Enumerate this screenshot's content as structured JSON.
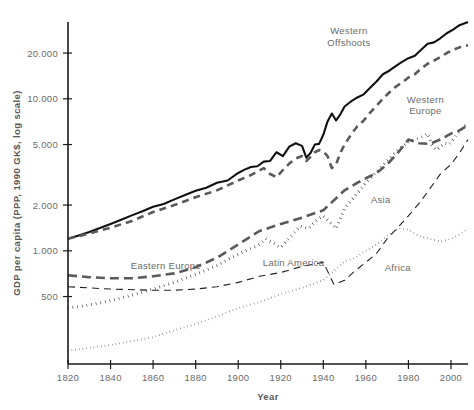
{
  "chart_data": {
    "type": "line",
    "title": "",
    "xlabel": "Year",
    "ylabel": "GDP per capita (PPP, 1990 GK$, log scale)",
    "yscale": "log",
    "xlim": [
      1820,
      2008
    ],
    "ylim": [
      180,
      32000
    ],
    "grid": false,
    "legend_position": "inline-annotations",
    "xticks": [
      1820,
      1840,
      1860,
      1880,
      1900,
      1920,
      1940,
      1960,
      1980,
      2000
    ],
    "xtick_labels": [
      "1820",
      "1840",
      "1860",
      "1880",
      "1900",
      "1920",
      "1940",
      "1960",
      "1980",
      "2000"
    ],
    "yticks": [
      500,
      1000,
      2000,
      5000,
      10000,
      20000
    ],
    "ytick_labels": [
      "500",
      "1.000",
      "2.000",
      "5.000",
      "10.000",
      "20.000"
    ],
    "series": [
      {
        "name": "Western Offshoots",
        "label": "Western Offshoots",
        "style": "solid",
        "color": "#111111",
        "width": 2.1,
        "label_x": 1952,
        "label_y": 26500,
        "x": [
          1820,
          1825,
          1830,
          1835,
          1840,
          1845,
          1850,
          1855,
          1860,
          1865,
          1870,
          1875,
          1880,
          1885,
          1890,
          1895,
          1900,
          1903,
          1906,
          1909,
          1912,
          1915,
          1918,
          1921,
          1924,
          1927,
          1930,
          1932,
          1934,
          1936,
          1938,
          1940,
          1942,
          1944,
          1946,
          1948,
          1950,
          1953,
          1956,
          1959,
          1962,
          1965,
          1968,
          1971,
          1974,
          1977,
          1980,
          1983,
          1986,
          1989,
          1992,
          1995,
          1998,
          2001,
          2004,
          2008
        ],
        "y": [
          1200,
          1260,
          1330,
          1410,
          1500,
          1600,
          1710,
          1820,
          1950,
          2030,
          2180,
          2330,
          2480,
          2600,
          2800,
          2900,
          3250,
          3420,
          3560,
          3600,
          3860,
          3900,
          4450,
          4200,
          4850,
          5100,
          4900,
          4100,
          4400,
          5000,
          5050,
          5800,
          7100,
          8000,
          7200,
          7900,
          8900,
          9600,
          10200,
          10700,
          11800,
          13000,
          14500,
          15300,
          16400,
          17500,
          18500,
          19200,
          21000,
          23000,
          23500,
          25000,
          27000,
          28500,
          30500,
          32000
        ]
      },
      {
        "name": "Western Europe",
        "label": "Western Europe",
        "style": "dashed",
        "color": "#5a5a5a",
        "width": 2.6,
        "dash": "7,5",
        "label_x": 1988,
        "label_y": 9400,
        "x": [
          1820,
          1830,
          1840,
          1850,
          1860,
          1870,
          1880,
          1890,
          1900,
          1906,
          1912,
          1915,
          1918,
          1921,
          1924,
          1927,
          1930,
          1932,
          1934,
          1936,
          1938,
          1940,
          1942,
          1944,
          1946,
          1948,
          1950,
          1953,
          1956,
          1959,
          1962,
          1965,
          1968,
          1971,
          1974,
          1977,
          1980,
          1983,
          1986,
          1989,
          1992,
          1995,
          1998,
          2001,
          2004,
          2008
        ],
        "y": [
          1200,
          1300,
          1420,
          1570,
          1800,
          2000,
          2250,
          2500,
          2900,
          3150,
          3500,
          3200,
          3050,
          3400,
          3750,
          4050,
          4200,
          3900,
          4150,
          4450,
          4600,
          4500,
          4200,
          3500,
          3700,
          4400,
          5000,
          5800,
          6600,
          7200,
          8100,
          9000,
          10000,
          11000,
          12000,
          12800,
          13800,
          14500,
          15800,
          17000,
          17800,
          18800,
          20000,
          21000,
          21800,
          22500
        ]
      },
      {
        "name": "Eastern Europe",
        "label": "Eastern Europe",
        "style": "thick-dotted",
        "color": "#111111",
        "width": 3.0,
        "dash": "0.5,4.2",
        "label_x": 1866,
        "label_y": 760,
        "x": [
          1820,
          1830,
          1840,
          1850,
          1860,
          1870,
          1880,
          1890,
          1900,
          1910,
          1913,
          1920,
          1925,
          1929,
          1933,
          1937,
          1940,
          1944,
          1946,
          1950,
          1955,
          1960,
          1965,
          1970,
          1975,
          1980,
          1985,
          1989,
          1991,
          1993,
          1995,
          1997,
          1999,
          2001,
          2003,
          2005,
          2008
        ],
        "y": [
          420,
          440,
          470,
          510,
          560,
          620,
          700,
          800,
          950,
          1100,
          1200,
          1050,
          1250,
          1450,
          1400,
          1600,
          1700,
          1500,
          1400,
          1900,
          2300,
          2800,
          3300,
          3900,
          4600,
          5200,
          5500,
          5900,
          5000,
          4600,
          4800,
          5100,
          5000,
          5400,
          5900,
          6300,
          7000
        ]
      },
      {
        "name": "Latin America",
        "label": "Latin America",
        "style": "long-dashed",
        "color": "#5a5a5a",
        "width": 2.6,
        "dash": "9,5",
        "label_x": 1926,
        "label_y": 800,
        "x": [
          1820,
          1830,
          1840,
          1850,
          1860,
          1870,
          1880,
          1890,
          1900,
          1910,
          1920,
          1930,
          1940,
          1950,
          1955,
          1960,
          1965,
          1970,
          1975,
          1980,
          1985,
          1990,
          1995,
          2000,
          2004,
          2008
        ],
        "y": [
          690,
          670,
          660,
          660,
          680,
          710,
          780,
          900,
          1100,
          1350,
          1500,
          1650,
          1850,
          2500,
          2750,
          3000,
          3250,
          3700,
          4400,
          5400,
          5100,
          5050,
          5400,
          5900,
          6200,
          6700
        ]
      },
      {
        "name": "Asia",
        "label": "Asia",
        "style": "thin-dashed",
        "color": "#222222",
        "width": 1.1,
        "dash": "7,5",
        "label_x": 1967,
        "label_y": 2050,
        "x": [
          1820,
          1840,
          1860,
          1870,
          1880,
          1890,
          1900,
          1910,
          1920,
          1930,
          1940,
          1945,
          1950,
          1955,
          1960,
          1965,
          1970,
          1975,
          1980,
          1985,
          1990,
          1995,
          2000,
          2004,
          2008
        ],
        "y": [
          580,
          560,
          550,
          550,
          560,
          580,
          620,
          680,
          720,
          790,
          840,
          600,
          640,
          740,
          840,
          960,
          1200,
          1420,
          1700,
          2050,
          2550,
          3200,
          3700,
          4400,
          5400
        ]
      },
      {
        "name": "Africa",
        "label": "Africa",
        "style": "fine-dotted",
        "color": "#555555",
        "width": 1.8,
        "dash": "0.5,3.2",
        "label_x": 1975,
        "label_y": 740,
        "x": [
          1820,
          1840,
          1860,
          1870,
          1880,
          1890,
          1900,
          1910,
          1920,
          1930,
          1940,
          1950,
          1955,
          1960,
          1965,
          1970,
          1973,
          1976,
          1980,
          1985,
          1990,
          1995,
          2000,
          2004,
          2008
        ],
        "y": [
          220,
          240,
          270,
          300,
          330,
          370,
          420,
          460,
          520,
          570,
          640,
          850,
          900,
          1000,
          1100,
          1250,
          1350,
          1400,
          1380,
          1250,
          1200,
          1150,
          1200,
          1280,
          1400
        ]
      }
    ]
  },
  "axes": {
    "x_title": "Year",
    "y_title": "GDP per capita (PPP, 1990 GK$, log scale)"
  }
}
